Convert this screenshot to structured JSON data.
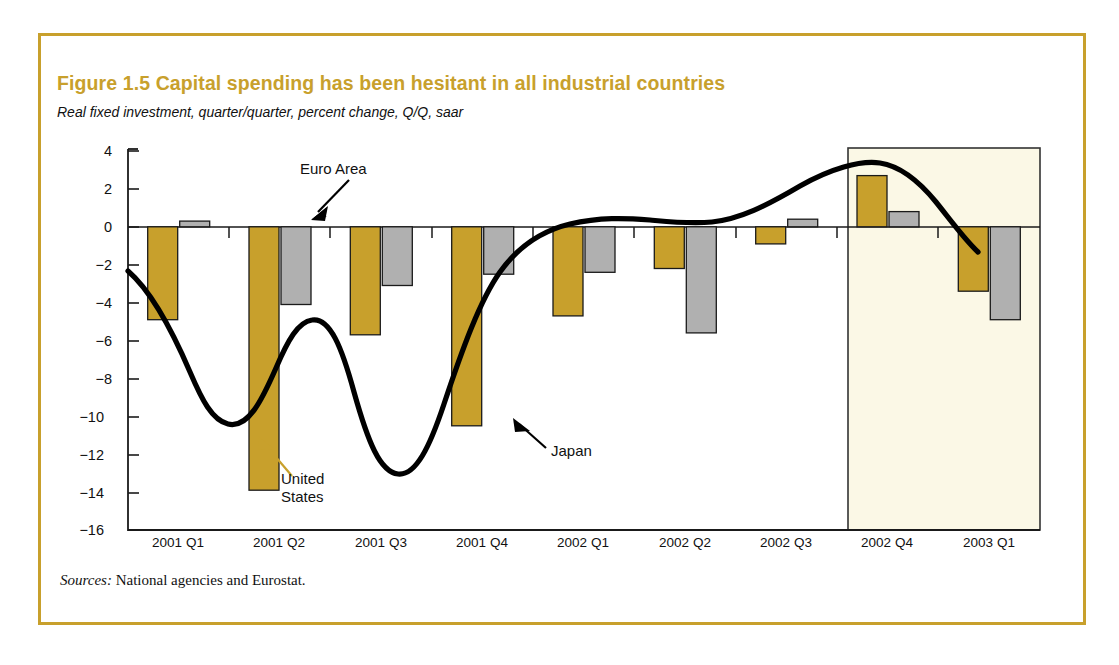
{
  "figure": {
    "title": "Figure 1.5  Capital spending has been hesitant in all industrial countries",
    "subtitle": "Real fixed investment, quarter/quarter, percent change, Q/Q, saar",
    "sources_label": "Sources:",
    "sources_text": " National agencies and Eurostat.",
    "frame_color": "#c8a02c",
    "title_color": "#c8a02c"
  },
  "annotations": {
    "euro_area": "Euro Area",
    "united_states_line1": "United",
    "united_states_line2": "States",
    "japan": "Japan"
  },
  "chart_data": {
    "type": "bar",
    "title": "Figure 1.5  Capital spending has been hesitant in all industrial countries",
    "subtitle": "Real fixed investment, quarter/quarter, percent change, Q/Q, saar",
    "xlabel": "",
    "ylabel": "",
    "ylim": [
      -16,
      4
    ],
    "yticks": [
      4,
      2,
      0,
      -2,
      -4,
      -6,
      -8,
      -10,
      -12,
      -14,
      -16
    ],
    "ytick_labels": [
      "4",
      "2",
      "0",
      "−2",
      "−4",
      "−6",
      "−8",
      "−10",
      "−12",
      "−14",
      "−16"
    ],
    "grid": false,
    "legend": "annotated-in-plot",
    "categories": [
      "2001 Q1",
      "2001 Q2",
      "2001 Q3",
      "2001 Q4",
      "2002 Q1",
      "2002 Q2",
      "2002 Q3",
      "2002 Q4",
      "2003 Q1"
    ],
    "series": [
      {
        "name": "United States",
        "kind": "bar",
        "color": "#c8a02c",
        "values": [
          -4.9,
          -13.9,
          -5.7,
          -10.5,
          -4.7,
          -2.2,
          -0.9,
          2.7,
          -3.4
        ]
      },
      {
        "name": "Euro Area",
        "kind": "bar",
        "color": "#b0b0b0",
        "values": [
          0.3,
          -4.1,
          -3.1,
          -2.5,
          -2.4,
          -5.6,
          0.4,
          0.8,
          -4.9
        ]
      },
      {
        "name": "Japan",
        "kind": "line",
        "color": "#000000",
        "values": [
          -2.3,
          -10.3,
          -5.9,
          -14.5,
          -3.4,
          0.3,
          0.2,
          3.2,
          -2.0
        ]
      }
    ],
    "shaded_region": {
      "label": "forecast",
      "from_category": "2002 Q4",
      "to_category": "2003 Q1",
      "fill": "#fbf8e6",
      "border": "#333333"
    }
  }
}
